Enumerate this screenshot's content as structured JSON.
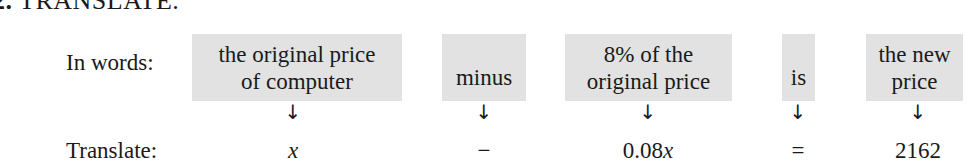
{
  "heading": {
    "number": "2.",
    "title": "TRANSLATE."
  },
  "rows": {
    "words_label": "In words:",
    "translate_label": "Translate:"
  },
  "phrases": [
    {
      "line1": "the original price",
      "line2": "of computer"
    },
    {
      "line1": "minus",
      "line2": ""
    },
    {
      "line1": "8% of the",
      "line2": "original price"
    },
    {
      "line1": "is",
      "line2": ""
    },
    {
      "line1": "the new",
      "line2": "price"
    }
  ],
  "arrow_glyph": "↓",
  "translations": [
    {
      "coef": "",
      "var": "x"
    },
    {
      "coef": "−",
      "var": ""
    },
    {
      "coef": "0.08",
      "var": "x"
    },
    {
      "coef": "=",
      "var": ""
    },
    {
      "coef": "2162",
      "var": ""
    }
  ],
  "colors": {
    "box_fill": "#e2e2e2",
    "text": "#1a1a1a"
  }
}
